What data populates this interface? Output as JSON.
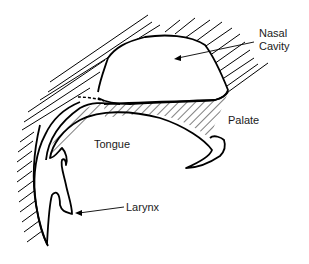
{
  "diagram": {
    "labels": {
      "nasal_cavity_line1": "Nasal",
      "nasal_cavity_line2": "Cavity",
      "palate": "Palate",
      "tongue": "Tongue",
      "larynx": "Larynx"
    },
    "colors": {
      "stroke": "#000000",
      "background": "#ffffff",
      "text": "#1a1a1a"
    }
  }
}
